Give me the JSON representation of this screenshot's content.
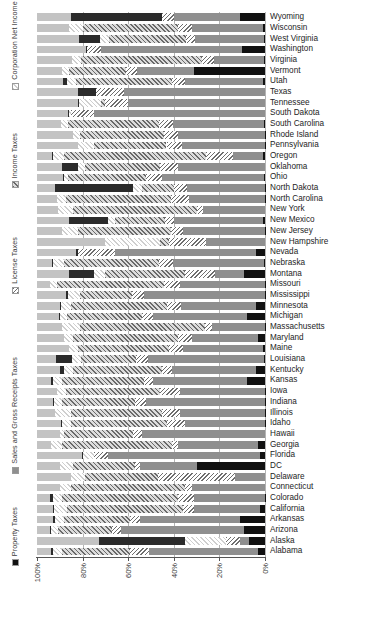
{
  "chart_data": {
    "type": "bar",
    "orientation": "horizontal",
    "stacked": true,
    "stack_mode": "percent",
    "title": "",
    "subtitle": "",
    "xlabel": "",
    "ylabel": "",
    "xlim": [
      100,
      0
    ],
    "x_reversed": true,
    "grid": "vertical",
    "legend_position": "left-rotated",
    "xticks": [
      "100%",
      "80%",
      "60%",
      "40%",
      "20%",
      "0%"
    ],
    "xtick_values": [
      100,
      80,
      60,
      40,
      20,
      0
    ],
    "legend": [
      {
        "label": "Property Taxes",
        "key": "property",
        "color": "#111111",
        "pattern": "solid"
      },
      {
        "label": "Sales and Gross Receipts Taxes",
        "key": "sales",
        "color": "#8f8f8f",
        "pattern": "solid"
      },
      {
        "label": "License Taxes",
        "key": "license",
        "color": "#6e6e6e",
        "pattern": "dense-hatch"
      },
      {
        "label": "Income Taxes",
        "key": "income",
        "color": "#6a6a6a",
        "pattern": "diagonal-hatch"
      },
      {
        "label": "Corporation Net Income Taxes",
        "key": "corp",
        "color": "#cfcfcf",
        "pattern": "light-hatch"
      },
      {
        "label": "Severance Taxes",
        "key": "severance",
        "color": "#2b2b2b",
        "pattern": "solid"
      },
      {
        "label": "Other",
        "key": "other",
        "color": "#c3c3c3",
        "pattern": "solid"
      }
    ],
    "series_order": [
      "property",
      "sales",
      "license",
      "income",
      "corp",
      "severance",
      "other"
    ],
    "categories": [
      "Wyoming",
      "Wisconsin",
      "West Virginia",
      "Washington",
      "Virginia",
      "Vermont",
      "Utah",
      "Texas",
      "Tennessee",
      "South Dakota",
      "South Carolina",
      "Rhode Island",
      "Pennsylvania",
      "Oregon",
      "Oklahoma",
      "Ohio",
      "North Dakota",
      "North Carolina",
      "New York",
      "New Mexico",
      "New Jersey",
      "New Hampshire",
      "Nevada",
      "Nebraska",
      "Montana",
      "Missouri",
      "Mississippi",
      "Minnesota",
      "Michigan",
      "Massachusetts",
      "Maryland",
      "Maine",
      "Louisiana",
      "Kentucky",
      "Kansas",
      "Iowa",
      "Indiana",
      "Illinois",
      "Idaho",
      "Hawaii",
      "Georgia",
      "Florida",
      "DC",
      "Delaware",
      "Connecticut",
      "Colorado",
      "California",
      "Arkansas",
      "Arizona",
      "Alaska",
      "Alabama"
    ],
    "rows": [
      {
        "state": "Wyoming",
        "property": 11.0,
        "sales": 29.0,
        "license": 5.0,
        "income": 0.0,
        "corp": 0.0,
        "severance": 40.0,
        "other": 15.0
      },
      {
        "state": "Wisconsin",
        "property": 1.0,
        "sales": 31.0,
        "license": 6.0,
        "income": 42.0,
        "corp": 6.0,
        "severance": 0.0,
        "other": 14.0
      },
      {
        "state": "West Virginia",
        "property": 0.5,
        "sales": 30.0,
        "license": 4.0,
        "income": 34.0,
        "corp": 4.0,
        "severance": 9.0,
        "other": 18.5
      },
      {
        "state": "Washington",
        "property": 10.0,
        "sales": 62.0,
        "license": 6.0,
        "income": 0.0,
        "corp": 0.0,
        "severance": 0.5,
        "other": 21.5
      },
      {
        "state": "Virginia",
        "property": 0.5,
        "sales": 22.0,
        "license": 5.0,
        "income": 53.0,
        "corp": 4.0,
        "severance": 0.0,
        "other": 15.5
      },
      {
        "state": "Vermont",
        "property": 31.0,
        "sales": 25.0,
        "license": 5.0,
        "income": 25.0,
        "corp": 3.0,
        "severance": 0.0,
        "other": 11.0
      },
      {
        "state": "Utah",
        "property": 1.0,
        "sales": 34.0,
        "license": 6.0,
        "income": 42.0,
        "corp": 4.0,
        "severance": 1.5,
        "other": 11.5
      },
      {
        "state": "Texas",
        "property": 0.0,
        "sales": 62.0,
        "license": 12.0,
        "income": 0.0,
        "corp": 0.0,
        "severance": 8.0,
        "other": 18.0
      },
      {
        "state": "Tennessee",
        "property": 0.0,
        "sales": 60.0,
        "license": 10.0,
        "income": 2.0,
        "corp": 10.0,
        "severance": 0.2,
        "other": 17.8
      },
      {
        "state": "South Dakota",
        "property": 0.0,
        "sales": 75.0,
        "license": 10.0,
        "income": 0.0,
        "corp": 1.0,
        "severance": 0.3,
        "other": 13.7
      },
      {
        "state": "South Carolina",
        "property": 0.3,
        "sales": 40.0,
        "license": 6.0,
        "income": 40.0,
        "corp": 3.0,
        "severance": 0.0,
        "other": 10.7
      },
      {
        "state": "Rhode Island",
        "property": 0.2,
        "sales": 38.0,
        "license": 6.0,
        "income": 37.0,
        "corp": 3.0,
        "severance": 0.0,
        "other": 15.8
      },
      {
        "state": "Pennsylvania",
        "property": 0.2,
        "sales": 36.0,
        "license": 7.0,
        "income": 32.0,
        "corp": 7.0,
        "severance": 0.0,
        "other": 17.8
      },
      {
        "state": "Oregon",
        "property": 1.0,
        "sales": 13.0,
        "license": 12.0,
        "income": 62.0,
        "corp": 5.0,
        "severance": 0.3,
        "other": 6.7
      },
      {
        "state": "Oklahoma",
        "property": 0.0,
        "sales": 38.0,
        "license": 8.0,
        "income": 33.0,
        "corp": 3.0,
        "severance": 7.0,
        "other": 11.0
      },
      {
        "state": "Ohio",
        "property": 0.3,
        "sales": 45.0,
        "license": 7.0,
        "income": 34.0,
        "corp": 2.0,
        "severance": 0.2,
        "other": 11.5
      },
      {
        "state": "North Dakota",
        "property": 0.1,
        "sales": 34.0,
        "license": 6.0,
        "income": 14.0,
        "corp": 4.0,
        "severance": 34.0,
        "other": 7.9
      },
      {
        "state": "North Carolina",
        "property": 0.2,
        "sales": 33.0,
        "license": 8.0,
        "income": 46.0,
        "corp": 4.0,
        "severance": 0.0,
        "other": 8.8
      },
      {
        "state": "New York",
        "property": 0.0,
        "sales": 27.0,
        "license": 3.0,
        "income": 54.0,
        "corp": 7.0,
        "severance": 0.0,
        "other": 9.0
      },
      {
        "state": "New Mexico",
        "property": 1.0,
        "sales": 39.0,
        "license": 4.0,
        "income": 22.0,
        "corp": 3.0,
        "severance": 17.0,
        "other": 14.0
      },
      {
        "state": "New Jersey",
        "property": 0.1,
        "sales": 36.0,
        "license": 5.0,
        "income": 41.0,
        "corp": 7.0,
        "severance": 0.0,
        "other": 10.9
      },
      {
        "state": "New Hampshire",
        "property": 0.0,
        "sales": 26.0,
        "license": 16.0,
        "income": 4.0,
        "corp": 24.0,
        "severance": 0.0,
        "other": 30.0
      },
      {
        "state": "Nevada",
        "property": 4.0,
        "sales": 62.0,
        "license": 16.0,
        "income": 0.0,
        "corp": 0.0,
        "severance": 1.0,
        "other": 17.0
      },
      {
        "state": "Nebraska",
        "property": 0.3,
        "sales": 40.0,
        "license": 6.0,
        "income": 42.0,
        "corp": 5.0,
        "severance": 0.2,
        "other": 6.5
      },
      {
        "state": "Montana",
        "property": 9.0,
        "sales": 13.0,
        "license": 13.0,
        "income": 35.0,
        "corp": 5.0,
        "severance": 11.0,
        "other": 14.0
      },
      {
        "state": "Missouri",
        "property": 0.2,
        "sales": 37.0,
        "license": 7.0,
        "income": 47.0,
        "corp": 3.0,
        "severance": 0.0,
        "other": 5.8
      },
      {
        "state": "Mississippi",
        "property": 0.2,
        "sales": 53.0,
        "license": 5.0,
        "income": 23.0,
        "corp": 5.0,
        "severance": 1.0,
        "other": 12.8
      },
      {
        "state": "Minnesota",
        "property": 4.0,
        "sales": 33.0,
        "license": 6.0,
        "income": 42.0,
        "corp": 5.0,
        "severance": 0.1,
        "other": 9.9
      },
      {
        "state": "Michigan",
        "property": 8.0,
        "sales": 41.0,
        "license": 5.0,
        "income": 33.0,
        "corp": 3.0,
        "severance": 0.3,
        "other": 9.7
      },
      {
        "state": "Massachusetts",
        "property": 0.1,
        "sales": 23.0,
        "license": 3.0,
        "income": 55.0,
        "corp": 8.0,
        "severance": 0.0,
        "other": 10.9
      },
      {
        "state": "Maryland",
        "property": 3.0,
        "sales": 29.0,
        "license": 6.0,
        "income": 46.0,
        "corp": 4.0,
        "severance": 0.0,
        "other": 12.0
      },
      {
        "state": "Maine",
        "property": 1.0,
        "sales": 35.0,
        "license": 6.0,
        "income": 40.0,
        "corp": 4.0,
        "severance": 0.0,
        "other": 14.0
      },
      {
        "state": "Louisiana",
        "property": 0.5,
        "sales": 51.0,
        "license": 5.0,
        "income": 24.0,
        "corp": 4.0,
        "severance": 7.0,
        "other": 8.5
      },
      {
        "state": "Kentucky",
        "property": 4.0,
        "sales": 37.0,
        "license": 4.0,
        "income": 39.0,
        "corp": 4.0,
        "severance": 2.0,
        "other": 10.0
      },
      {
        "state": "Kansas",
        "property": 8.0,
        "sales": 41.0,
        "license": 4.0,
        "income": 36.0,
        "corp": 4.0,
        "severance": 1.0,
        "other": 6.0
      },
      {
        "state": "Iowa",
        "property": 0.1,
        "sales": 37.0,
        "license": 9.0,
        "income": 41.0,
        "corp": 4.0,
        "severance": 0.0,
        "other": 8.9
      },
      {
        "state": "Indiana",
        "property": 0.1,
        "sales": 52.0,
        "license": 5.0,
        "income": 32.0,
        "corp": 4.0,
        "severance": 0.1,
        "other": 6.8
      },
      {
        "state": "Illinois",
        "property": 0.1,
        "sales": 37.0,
        "license": 8.0,
        "income": 40.0,
        "corp": 7.0,
        "severance": 0.0,
        "other": 7.9
      },
      {
        "state": "Idaho",
        "property": 0.1,
        "sales": 35.0,
        "license": 8.0,
        "income": 42.0,
        "corp": 4.0,
        "severance": 0.2,
        "other": 10.7
      },
      {
        "state": "Hawaii",
        "property": 0.0,
        "sales": 54.0,
        "license": 4.0,
        "income": 30.0,
        "corp": 2.0,
        "severance": 0.0,
        "other": 10.0
      },
      {
        "state": "Georgia",
        "property": 3.0,
        "sales": 35.0,
        "license": 3.0,
        "income": 48.0,
        "corp": 5.0,
        "severance": 0.0,
        "other": 6.0
      },
      {
        "state": "Florida",
        "property": 2.0,
        "sales": 67.0,
        "license": 6.0,
        "income": 0.0,
        "corp": 5.0,
        "severance": 0.2,
        "other": 19.8
      },
      {
        "state": "DC",
        "property": 30.0,
        "sales": 25.0,
        "license": 2.0,
        "income": 27.0,
        "corp": 6.0,
        "severance": 0.0,
        "other": 10.0
      },
      {
        "state": "Delaware",
        "property": 0.0,
        "sales": 13.0,
        "license": 34.0,
        "income": 32.0,
        "corp": 6.0,
        "severance": 0.0,
        "other": 15.0
      },
      {
        "state": "Connecticut",
        "property": 0.0,
        "sales": 32.0,
        "license": 3.0,
        "income": 50.0,
        "corp": 5.0,
        "severance": 0.0,
        "other": 10.0
      },
      {
        "state": "Colorado",
        "property": 0.1,
        "sales": 31.0,
        "license": 7.0,
        "income": 51.0,
        "corp": 4.0,
        "severance": 1.0,
        "other": 5.9
      },
      {
        "state": "California",
        "property": 2.0,
        "sales": 29.0,
        "license": 5.0,
        "income": 51.0,
        "corp": 6.0,
        "severance": 0.1,
        "other": 6.9
      },
      {
        "state": "Arkansas",
        "property": 11.0,
        "sales": 44.0,
        "license": 4.0,
        "income": 29.0,
        "corp": 4.0,
        "severance": 1.0,
        "other": 7.0
      },
      {
        "state": "Arizona",
        "property": 9.0,
        "sales": 54.0,
        "license": 4.0,
        "income": 24.0,
        "corp": 3.0,
        "severance": 0.3,
        "other": 5.7
      },
      {
        "state": "Alaska",
        "property": 7.0,
        "sales": 4.0,
        "license": 6.0,
        "income": 0.0,
        "corp": 18.0,
        "severance": 38.0,
        "other": 27.0
      },
      {
        "state": "Alabama",
        "property": 3.0,
        "sales": 48.0,
        "license": 8.0,
        "income": 30.0,
        "corp": 4.0,
        "severance": 1.0,
        "other": 6.0
      }
    ]
  }
}
